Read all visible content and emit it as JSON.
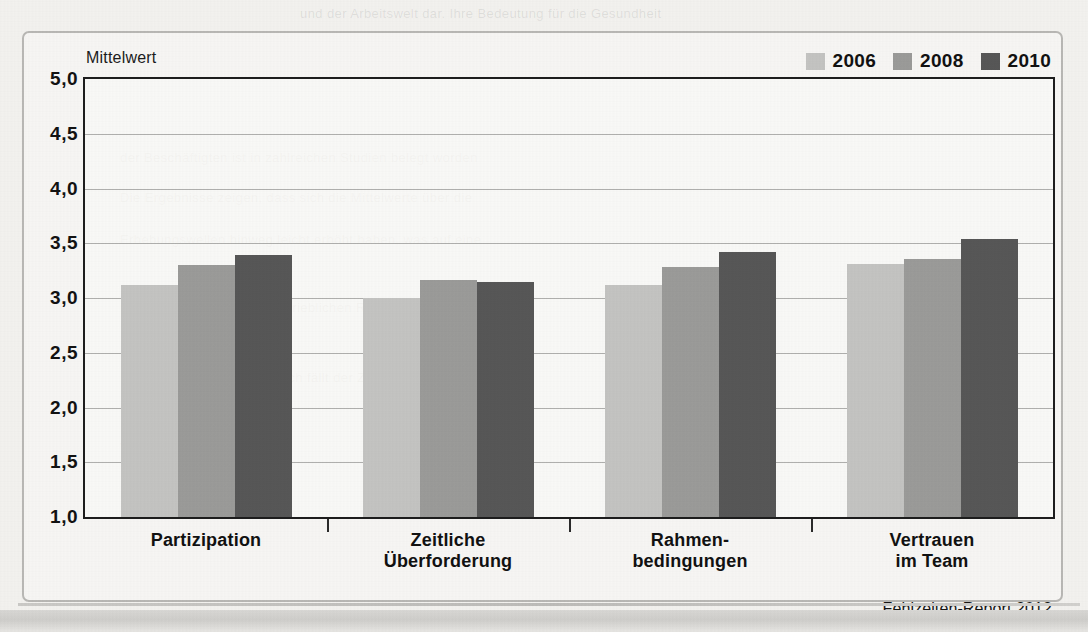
{
  "figure": {
    "axis_title": "Mittelwert",
    "source_note": "Fehlzeiten-Report 2012"
  },
  "legend": {
    "items": [
      {
        "label": "2006",
        "color": "#c4c4c2"
      },
      {
        "label": "2008",
        "color": "#9b9b99"
      },
      {
        "label": "2010",
        "color": "#575757"
      }
    ]
  },
  "y_axis": {
    "ticks": [
      "5,0",
      "4,5",
      "4,0",
      "3,5",
      "3,0",
      "2,5",
      "2,0",
      "1,5",
      "1,0"
    ]
  },
  "categories": [
    {
      "lines": [
        "Partizipation"
      ]
    },
    {
      "lines": [
        "Zeitliche",
        "Überforderung"
      ]
    },
    {
      "lines": [
        "Rahmen-",
        "bedingungen"
      ]
    },
    {
      "lines": [
        "Vertrauen",
        "im Team"
      ]
    }
  ],
  "background_text": {
    "line1": "und der Arbeitswelt dar. Ihre Bedeutung für die Gesundheit",
    "line2": "der Beschäftigten ist in zahlreichen Studien belegt worden",
    "line3": "Die Ergebnisse zeigen, dass sich die Mittelwerte über die",
    "line4": "Erhebungswellen hinweg leicht erhöht haben, was auf eine",
    "line5": "positive Entwicklung der betrieblichen Rahmenbedingungen",
    "line6": "hindeutet. Besonders deutlich fällt der Zuwachs beim",
    "line7": "Vertrauen im Team aus."
  },
  "chart_data": {
    "type": "bar",
    "title": "",
    "xlabel": "",
    "ylabel": "Mittelwert",
    "ylim": [
      1.0,
      5.0
    ],
    "ytick_values": [
      1.0,
      1.5,
      2.0,
      2.5,
      3.0,
      3.5,
      4.0,
      4.5,
      5.0
    ],
    "grid": true,
    "legend_position": "top-right",
    "categories": [
      "Partizipation",
      "Zeitliche Überforderung",
      "Rahmen-bedingungen",
      "Vertrauen im Team"
    ],
    "series": [
      {
        "name": "2006",
        "color": "#c4c4c2",
        "values": [
          3.12,
          3.0,
          3.12,
          3.31
        ]
      },
      {
        "name": "2008",
        "color": "#9b9b99",
        "values": [
          3.3,
          3.16,
          3.28,
          3.36
        ]
      },
      {
        "name": "2010",
        "color": "#575757",
        "values": [
          3.39,
          3.15,
          3.42,
          3.54
        ]
      }
    ],
    "source": "Fehlzeiten-Report 2012"
  }
}
